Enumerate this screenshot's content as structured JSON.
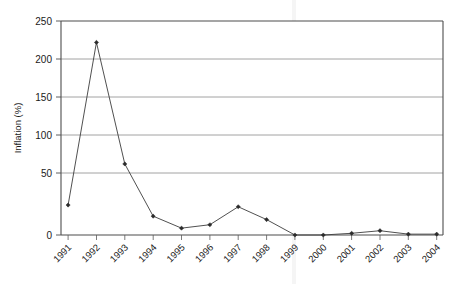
{
  "chart_data": {
    "type": "line",
    "title": "",
    "xlabel": "",
    "ylabel": "Inflation (%)",
    "categories": [
      "1991",
      "1992",
      "1993",
      "1994",
      "1995",
      "1996",
      "1997",
      "1998",
      "1999",
      "2000",
      "2001",
      "2002",
      "2003",
      "2004"
    ],
    "values": [
      35,
      225,
      83,
      22,
      8,
      12,
      33,
      18,
      0,
      0,
      2,
      5,
      1,
      1
    ],
    "series": [
      {
        "name": "Inflation (%)",
        "values": [
          35,
          225,
          83,
          22,
          8,
          12,
          33,
          18,
          0,
          0,
          2,
          5,
          1,
          1
        ]
      }
    ],
    "ylim": [
      0,
      250
    ],
    "ytick_labels": [
      "0",
      "50",
      "100",
      "150",
      "200",
      "250"
    ],
    "ytick_values": [
      0,
      50,
      100,
      150,
      200,
      250
    ],
    "grid": true,
    "grid_axis": "y",
    "legend": false,
    "legend_position": "none",
    "marker": "diamond",
    "line_color": "#3c3c3c",
    "marker_color": "#2b2b2b",
    "background_color": "#ffffff",
    "xtick_rotation": 45
  },
  "axes": {
    "y_title": "Inflation (%)",
    "x_title": ""
  }
}
